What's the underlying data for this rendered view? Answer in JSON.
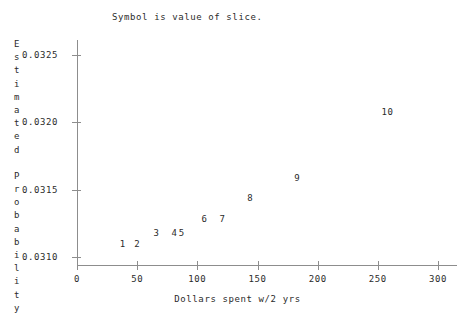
{
  "chart_data": {
    "type": "scatter",
    "title": "Symbol is value of slice.",
    "xlabel": "Dollars spent w/2 yrs",
    "ylabel": "Estimated Probability",
    "ylabel_lines": [
      "E",
      "s",
      "t",
      "i",
      "m",
      "a",
      "t",
      "e",
      "d",
      "",
      "P",
      "r",
      "o",
      "b",
      "a",
      "b",
      "i",
      "l",
      "i",
      "t",
      "y"
    ],
    "xlim": [
      0,
      300
    ],
    "ylim": [
      0.031,
      0.0325
    ],
    "grid": false,
    "legend": null,
    "point_labels_are_values": true,
    "xticks": [
      {
        "value": 0,
        "label": "0"
      },
      {
        "value": 50,
        "label": "50"
      },
      {
        "value": 100,
        "label": "100"
      },
      {
        "value": 150,
        "label": "150"
      },
      {
        "value": 200,
        "label": "200"
      },
      {
        "value": 250,
        "label": "250"
      },
      {
        "value": 300,
        "label": "300"
      }
    ],
    "yticks": [
      {
        "value": 0.031,
        "label": "0.0310"
      },
      {
        "value": 0.0315,
        "label": "0.0315"
      },
      {
        "value": 0.032,
        "label": "0.0320"
      },
      {
        "value": 0.0325,
        "label": "0.0325"
      }
    ],
    "points": [
      {
        "symbol": "1",
        "x": 38,
        "y": 0.0311
      },
      {
        "symbol": "2",
        "x": 50,
        "y": 0.0311
      },
      {
        "symbol": "3",
        "x": 66,
        "y": 0.03118
      },
      {
        "symbol": "4",
        "x": 81,
        "y": 0.03118
      },
      {
        "symbol": "5",
        "x": 87,
        "y": 0.03118
      },
      {
        "symbol": "6",
        "x": 106,
        "y": 0.03128
      },
      {
        "symbol": "7",
        "x": 121,
        "y": 0.03128
      },
      {
        "symbol": "8",
        "x": 144,
        "y": 0.03144
      },
      {
        "symbol": "9",
        "x": 183,
        "y": 0.03159
      },
      {
        "symbol": "10",
        "x": 258,
        "y": 0.03208
      }
    ],
    "colors": {
      "axis": "#8d8d8d",
      "text": "#2b2b2b",
      "background": "#ffffff"
    }
  }
}
